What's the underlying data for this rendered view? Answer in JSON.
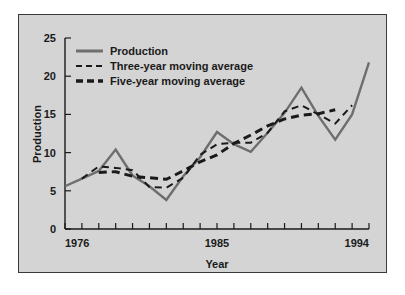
{
  "chart_data": {
    "type": "line",
    "title": "",
    "xlabel": "Year",
    "ylabel": "Production",
    "xlim": [
      1976,
      1994
    ],
    "ylim": [
      0,
      25
    ],
    "yticks": [
      0,
      5,
      10,
      15,
      20,
      25
    ],
    "xticks": [
      1976,
      1977,
      1978,
      1979,
      1980,
      1981,
      1982,
      1983,
      1984,
      1985,
      1986,
      1987,
      1988,
      1989,
      1990,
      1991,
      1992,
      1993,
      1994
    ],
    "xtick_labels_shown": [
      "1976",
      "1985",
      "1994"
    ],
    "grid": false,
    "legend_position": "upper-left-inside",
    "x": [
      1976,
      1977,
      1978,
      1979,
      1980,
      1981,
      1982,
      1983,
      1984,
      1985,
      1986,
      1987,
      1988,
      1989,
      1990,
      1991,
      1992,
      1993,
      1994
    ],
    "series": [
      {
        "name": "Production",
        "style": "solid",
        "color": "#6e6e6e",
        "values": [
          5.6,
          6.6,
          7.6,
          10.4,
          7.0,
          5.6,
          3.8,
          6.9,
          9.4,
          12.7,
          11.1,
          10.1,
          12.6,
          15.2,
          18.5,
          14.8,
          11.7,
          15.0,
          21.8
        ]
      },
      {
        "name": "Three-year moving average",
        "style": "dashed-thin",
        "color": "#1a1a1a",
        "values": [
          null,
          6.6,
          8.2,
          8.0,
          7.7,
          5.5,
          5.4,
          6.7,
          9.7,
          11.1,
          11.3,
          11.3,
          12.6,
          15.4,
          16.2,
          15.0,
          13.8,
          16.2,
          null
        ]
      },
      {
        "name": "Five-year moving average",
        "style": "dashed-thick",
        "color": "#1a1a1a",
        "values": [
          null,
          null,
          7.4,
          7.5,
          6.9,
          6.7,
          6.5,
          7.6,
          8.8,
          9.7,
          11.2,
          12.3,
          13.5,
          14.4,
          14.9,
          15.1,
          15.6,
          null,
          null
        ]
      }
    ]
  },
  "axes": {
    "ylabel": "Production",
    "xlabel": "Year",
    "ytick_labels": [
      "0",
      "5",
      "10",
      "15",
      "20",
      "25"
    ],
    "xtick_label_start": "1976",
    "xtick_label_mid": "1985",
    "xtick_label_end": "1994"
  },
  "legend": {
    "items": [
      {
        "label": "Production",
        "style": "solid"
      },
      {
        "label": "Three-year moving average",
        "style": "dashed-thin"
      },
      {
        "label": "Five-year moving average",
        "style": "dashed-thick"
      }
    ]
  }
}
